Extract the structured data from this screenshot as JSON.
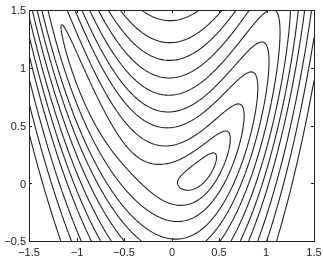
{
  "chart_data": {
    "type": "contour",
    "title": "",
    "xlabel": "",
    "ylabel": "",
    "xlim": [
      -1.5,
      1.5
    ],
    "ylim": [
      -0.5,
      1.5
    ],
    "grid": false,
    "xticks": [
      "-1.5",
      "-1",
      "-0.5",
      "0",
      "0.5",
      "1",
      "1.5"
    ],
    "yticks": [
      "-0.5",
      "0",
      "0.5",
      "1",
      "1.5"
    ],
    "function": "banana-shaped valley with closed contours near (-1,1) and (0.3,0.05)",
    "levels": [
      0.05,
      0.2,
      0.5,
      1,
      1.6,
      2.4,
      3.4,
      4.6,
      6,
      8,
      10.5,
      14
    ],
    "line_color": "#222222"
  },
  "axes": {
    "x_ticks": [
      {
        "label": "−1.5",
        "px": 29
      },
      {
        "label": "−1",
        "px": 77
      },
      {
        "label": "−0.5",
        "px": 124
      },
      {
        "label": "0",
        "px": 172
      },
      {
        "label": "0.5",
        "px": 219
      },
      {
        "label": "1",
        "px": 266
      },
      {
        "label": "1.5",
        "px": 314
      }
    ],
    "y_ticks": [
      {
        "label": "1.5",
        "px": 10
      },
      {
        "label": "1",
        "px": 68
      },
      {
        "label": "0.5",
        "px": 126
      },
      {
        "label": "0",
        "px": 184
      },
      {
        "label": "−0.5",
        "px": 241
      }
    ]
  }
}
